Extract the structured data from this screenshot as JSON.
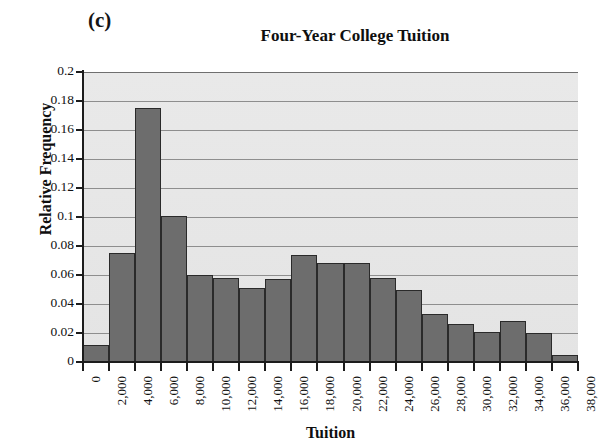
{
  "panel_label": "(c)",
  "chart_data": {
    "type": "bar",
    "title": "Four-Year College Tuition",
    "xlabel": "Tuition",
    "ylabel": "Relative Frequency",
    "ylim": [
      0,
      0.2
    ],
    "xlim": [
      0,
      38000
    ],
    "grid": true,
    "legend": null,
    "bin_width": 2000,
    "y_ticks": [
      "0",
      "0.02",
      "0.04",
      "0.06",
      "0.08",
      "0.1",
      "0.12",
      "0.14",
      "0.16",
      "0.18",
      "0.2"
    ],
    "y_tick_values": [
      0,
      0.02,
      0.04,
      0.06,
      0.08,
      0.1,
      0.12,
      0.14,
      0.16,
      0.18,
      0.2
    ],
    "x_ticks": [
      "0",
      "2,000",
      "4,000",
      "6,000",
      "8,000",
      "10,000",
      "12,000",
      "14,000",
      "16,000",
      "18,000",
      "20,000",
      "22,000",
      "24,000",
      "26,000",
      "28,000",
      "30,000",
      "32,000",
      "34,000",
      "36,000",
      "38,000"
    ],
    "x_tick_values": [
      0,
      2000,
      4000,
      6000,
      8000,
      10000,
      12000,
      14000,
      16000,
      18000,
      20000,
      22000,
      24000,
      26000,
      28000,
      30000,
      32000,
      34000,
      36000,
      38000
    ],
    "categories": [
      "0-2,000",
      "2,000-4,000",
      "4,000-6,000",
      "6,000-8,000",
      "8,000-10,000",
      "10,000-12,000",
      "12,000-14,000",
      "14,000-16,000",
      "16,000-18,000",
      "18,000-20,000",
      "20,000-22,000",
      "22,000-24,000",
      "24,000-26,000",
      "26,000-28,000",
      "28,000-30,000",
      "30,000-32,000",
      "32,000-34,000",
      "34,000-36,000",
      "36,000-38,000"
    ],
    "values": [
      0.012,
      0.075,
      0.175,
      0.101,
      0.06,
      0.058,
      0.051,
      0.057,
      0.074,
      0.068,
      0.068,
      0.058,
      0.05,
      0.033,
      0.026,
      0.021,
      0.028,
      0.02,
      0.005
    ],
    "colors": {
      "bar_fill": "#6d6d6d",
      "bar_edge": "#2a2a2a",
      "plot_background": "#e6e6e6",
      "gridline": "#8e8e8e",
      "axis": "#1c1c1c",
      "text": "#111111"
    }
  }
}
